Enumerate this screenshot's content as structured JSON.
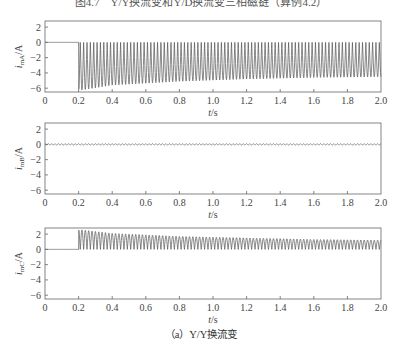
{
  "figure": {
    "title": "图4.7　Y/Y换流变和Y/D换流变三相磁链（算例4.2）",
    "caption": "（a）Y/Y换流变"
  },
  "chart_data": [
    {
      "type": "line",
      "title": "",
      "xlabel": "t/s",
      "ylabel": "i_mA/A",
      "ylabel_main": "i",
      "ylabel_sub": "mA",
      "ylabel_unit": "/A",
      "xlim": [
        0,
        2.0
      ],
      "ylim": [
        -6.5,
        2.8
      ],
      "xticks": [
        "0",
        "0.2",
        "0.4",
        "0.6",
        "0.8",
        "1.0",
        "1.2",
        "1.4",
        "1.6",
        "1.8",
        "2.0"
      ],
      "yticks": [
        "2",
        "0",
        "-2",
        "-4",
        "-6"
      ],
      "grid": false,
      "description": "Zero until t=0.2 s, then high-frequency pulses between 0 and a negative peak; peak about -6.3 A at 0.2 s decaying to about -4.5 A at 2.0 s",
      "envelope": {
        "t": [
          0.0,
          0.2,
          0.2,
          0.4,
          0.8,
          1.2,
          1.6,
          2.0
        ],
        "upper": [
          0,
          0,
          0,
          0,
          0,
          0,
          0,
          0
        ],
        "lower": [
          0,
          0,
          -6.3,
          -5.6,
          -5.1,
          -4.8,
          -4.6,
          -4.5
        ]
      },
      "switch_on_time": 0.2,
      "oscillation_cycles": 90
    },
    {
      "type": "line",
      "title": "",
      "xlabel": "t/s",
      "ylabel": "i_mB/A",
      "ylabel_main": "i",
      "ylabel_sub": "mB",
      "ylabel_unit": "/A",
      "xlim": [
        0,
        2.0
      ],
      "ylim": [
        -6.5,
        2.8
      ],
      "xticks": [
        "0",
        "0.2",
        "0.4",
        "0.6",
        "0.8",
        "1.0",
        "1.2",
        "1.4",
        "1.6",
        "1.8",
        "2.0"
      ],
      "yticks": [
        "2",
        "0",
        "-2",
        "-4",
        "-6"
      ],
      "grid": false,
      "description": "Small ripple around 0 A over the whole interval (amplitude about 0.1 A)",
      "envelope": {
        "t": [
          0.0,
          2.0
        ],
        "upper": [
          0.1,
          0.1
        ],
        "lower": [
          -0.1,
          -0.1
        ]
      },
      "switch_on_time": 0.0,
      "oscillation_cycles": 100
    },
    {
      "type": "line",
      "title": "",
      "xlabel": "t/s",
      "ylabel": "i_mC/A",
      "ylabel_main": "i",
      "ylabel_sub": "mC",
      "ylabel_unit": "/A",
      "xlim": [
        0,
        2.0
      ],
      "ylim": [
        -6.5,
        2.8
      ],
      "xticks": [
        "0",
        "0.2",
        "0.4",
        "0.6",
        "0.8",
        "1.0",
        "1.2",
        "1.4",
        "1.6",
        "1.8",
        "2.0"
      ],
      "yticks": [
        "2",
        "0",
        "-2",
        "-4",
        "-6"
      ],
      "grid": false,
      "description": "Zero until t=0.2 s, then positive pulses between 0 and a peak of about 2.6 A decaying to about 1.2 A at 2.0 s",
      "envelope": {
        "t": [
          0.0,
          0.2,
          0.2,
          0.4,
          0.8,
          1.2,
          1.6,
          2.0
        ],
        "upper": [
          0,
          0,
          2.6,
          2.1,
          1.7,
          1.5,
          1.3,
          1.2
        ],
        "lower": [
          0,
          0,
          0,
          0,
          0,
          0,
          0,
          0
        ]
      },
      "switch_on_time": 0.2,
      "oscillation_cycles": 90
    }
  ],
  "layout": {
    "plot_left": 45,
    "plot_right": 381,
    "panels": [
      {
        "top": 21,
        "bottom": 92
      },
      {
        "top": 123,
        "bottom": 194
      },
      {
        "top": 228,
        "bottom": 299
      }
    ],
    "line_color": "#555555",
    "axis_color": "#666666"
  }
}
